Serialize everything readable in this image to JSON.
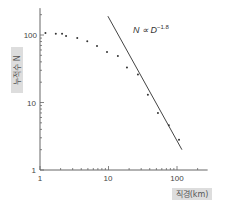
{
  "chart_data": {
    "type": "scatter",
    "title": "",
    "xlabel": "직경(km)",
    "ylabel": "누적수 N",
    "xscale": "log",
    "yscale": "log",
    "xlim": [
      1,
      280
    ],
    "ylim": [
      1,
      250
    ],
    "grid": false,
    "legend": null,
    "x_ticks": [
      "1",
      "10",
      "100"
    ],
    "y_ticks": [
      "1",
      "10",
      "100"
    ],
    "series": [
      {
        "name": "cumulative count",
        "kind": "scatter",
        "x": [
          1.2,
          1.7,
          2.1,
          2.4,
          3.5,
          4.9,
          6.8,
          9.5,
          13.7,
          18.6,
          26.9,
          37.6,
          52.7,
          76,
          107
        ],
        "y": [
          107,
          104,
          104,
          97,
          90,
          81,
          69,
          56,
          49,
          33,
          26,
          13,
          7,
          4.6,
          2.8
        ]
      },
      {
        "name": "power-law fit",
        "kind": "line",
        "x": [
          9.8,
          118
        ],
        "y": [
          190,
          2.0
        ]
      }
    ],
    "annotations": [
      {
        "text": "N ∝ D^-1.8",
        "base": "N ∝ D",
        "exponent": "−1.8",
        "x": 22,
        "y": 150
      }
    ]
  },
  "labels": {
    "xlabel": "직경(km)",
    "ylabel": "누적수 N",
    "annotation_base": "N ∝ D",
    "annotation_exp": "−1.8",
    "x_tick_1": "1",
    "x_tick_10": "10",
    "x_tick_100": "100",
    "y_tick_1": "1",
    "y_tick_10": "10",
    "y_tick_100": "100"
  },
  "colors": {
    "axis": "#666666",
    "points": "#333333",
    "fit_line": "#444444",
    "label_bg": "#dddddd"
  }
}
